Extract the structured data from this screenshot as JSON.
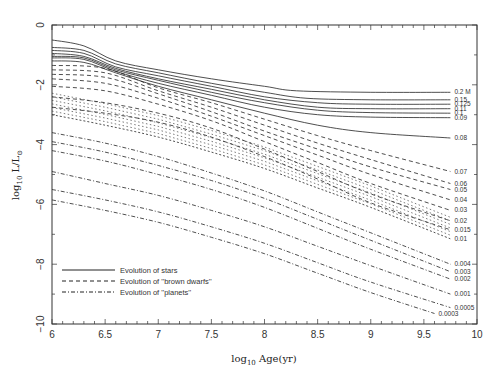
{
  "chart_data": {
    "type": "line",
    "title": "",
    "xlabel": "log10 Age(yr)",
    "ylabel": "log10 L/L_sun",
    "xlim": [
      6,
      10
    ],
    "ylim": [
      -10,
      0
    ],
    "grid": false,
    "x_ticks": [
      "6",
      "6.5",
      "7",
      "7.5",
      "8",
      "8.5",
      "9",
      "9.5",
      "10"
    ],
    "y_ticks": [
      "0",
      "-2",
      "-4",
      "-6",
      "-8",
      "-10"
    ],
    "legend": {
      "position": "lower-left",
      "entries": [
        {
          "label": "Evolution of stars",
          "style": "solid"
        },
        {
          "label": "Evolution of ''brown dwarfs''",
          "style": "dashed"
        },
        {
          "label": "Evolution of ''planets''",
          "style": "dashdot"
        }
      ]
    },
    "mass_unit_label": "M",
    "series": [
      {
        "name": "0.2",
        "label": "0.2 M",
        "class": "star",
        "points": [
          [
            6,
            -0.5
          ],
          [
            6.3,
            -0.7
          ],
          [
            6.6,
            -1.2
          ],
          [
            7,
            -1.5
          ],
          [
            7.5,
            -1.8
          ],
          [
            8,
            -2.05
          ],
          [
            8.3,
            -2.2
          ],
          [
            9,
            -2.25
          ],
          [
            9.75,
            -2.25
          ]
        ]
      },
      {
        "name": "0.15",
        "label": "0.15",
        "class": "star",
        "points": [
          [
            6,
            -0.75
          ],
          [
            6.3,
            -0.85
          ],
          [
            6.6,
            -1.3
          ],
          [
            7,
            -1.6
          ],
          [
            7.5,
            -1.95
          ],
          [
            8,
            -2.25
          ],
          [
            8.4,
            -2.45
          ],
          [
            9,
            -2.5
          ],
          [
            9.75,
            -2.5
          ]
        ]
      },
      {
        "name": "0.125",
        "label": "0.125",
        "class": "star",
        "points": [
          [
            6,
            -0.85
          ],
          [
            6.3,
            -0.95
          ],
          [
            6.6,
            -1.4
          ],
          [
            7,
            -1.7
          ],
          [
            7.5,
            -2.05
          ],
          [
            8,
            -2.4
          ],
          [
            8.5,
            -2.6
          ],
          [
            9,
            -2.65
          ],
          [
            9.75,
            -2.65
          ]
        ]
      },
      {
        "name": "0.11",
        "label": "0.11",
        "class": "star",
        "points": [
          [
            6,
            -0.95
          ],
          [
            6.3,
            -1.05
          ],
          [
            6.6,
            -1.45
          ],
          [
            7,
            -1.8
          ],
          [
            7.5,
            -2.15
          ],
          [
            8,
            -2.5
          ],
          [
            8.5,
            -2.75
          ],
          [
            9,
            -2.8
          ],
          [
            9.75,
            -2.8
          ]
        ]
      },
      {
        "name": "0.1",
        "label": "0.1",
        "class": "star",
        "points": [
          [
            6,
            -1.05
          ],
          [
            6.3,
            -1.1
          ],
          [
            6.6,
            -1.5
          ],
          [
            7,
            -1.85
          ],
          [
            7.5,
            -2.25
          ],
          [
            8,
            -2.6
          ],
          [
            8.5,
            -2.85
          ],
          [
            9,
            -2.93
          ],
          [
            9.75,
            -2.95
          ]
        ]
      },
      {
        "name": "0.09",
        "label": "0.09",
        "class": "star",
        "points": [
          [
            6,
            -1.1
          ],
          [
            6.3,
            -1.15
          ],
          [
            6.6,
            -1.55
          ],
          [
            7,
            -1.95
          ],
          [
            7.5,
            -2.35
          ],
          [
            8,
            -2.75
          ],
          [
            8.5,
            -3.0
          ],
          [
            9,
            -3.08
          ],
          [
            9.75,
            -3.1
          ]
        ]
      },
      {
        "name": "0.08",
        "label": "0.08",
        "class": "star",
        "points": [
          [
            6,
            -1.2
          ],
          [
            6.3,
            -1.25
          ],
          [
            6.6,
            -1.6
          ],
          [
            7,
            -2.05
          ],
          [
            7.5,
            -2.5
          ],
          [
            8,
            -2.95
          ],
          [
            8.5,
            -3.35
          ],
          [
            9,
            -3.6
          ],
          [
            9.75,
            -3.78
          ]
        ]
      },
      {
        "name": "0.07",
        "label": "0.07",
        "class": "bd",
        "points": [
          [
            6,
            -1.35
          ],
          [
            6.5,
            -1.45
          ],
          [
            7,
            -2.1
          ],
          [
            7.5,
            -2.6
          ],
          [
            8,
            -3.15
          ],
          [
            8.5,
            -3.7
          ],
          [
            9,
            -4.2
          ],
          [
            9.75,
            -4.9
          ]
        ]
      },
      {
        "name": "0.06",
        "label": "0.06",
        "class": "bd",
        "points": [
          [
            6,
            -1.5
          ],
          [
            6.5,
            -1.6
          ],
          [
            7,
            -2.2
          ],
          [
            7.5,
            -2.75
          ],
          [
            8,
            -3.35
          ],
          [
            8.5,
            -3.95
          ],
          [
            9,
            -4.5
          ],
          [
            9.75,
            -5.3
          ]
        ]
      },
      {
        "name": "0.05",
        "label": "0.05",
        "class": "bd",
        "points": [
          [
            6,
            -1.65
          ],
          [
            6.5,
            -1.75
          ],
          [
            7,
            -2.3
          ],
          [
            7.5,
            -2.9
          ],
          [
            8,
            -3.55
          ],
          [
            8.5,
            -4.15
          ],
          [
            9,
            -4.75
          ],
          [
            9.75,
            -5.5
          ]
        ]
      },
      {
        "name": "0.04",
        "label": "0.04",
        "class": "bd",
        "points": [
          [
            6,
            -1.8
          ],
          [
            6.5,
            -1.95
          ],
          [
            7,
            -2.45
          ],
          [
            7.5,
            -3.05
          ],
          [
            8,
            -3.7
          ],
          [
            8.5,
            -4.35
          ],
          [
            9,
            -5.0
          ],
          [
            9.75,
            -5.85
          ]
        ]
      },
      {
        "name": "0.03",
        "label": "0.03",
        "class": "bd",
        "points": [
          [
            6,
            -2.05
          ],
          [
            6.5,
            -2.2
          ],
          [
            7,
            -2.65
          ],
          [
            7.5,
            -3.2
          ],
          [
            8,
            -3.9
          ],
          [
            8.5,
            -4.6
          ],
          [
            9,
            -5.3
          ],
          [
            9.75,
            -6.2
          ]
        ]
      },
      {
        "name": "0.02",
        "label": "0.02",
        "class": "bd",
        "points": [
          [
            6,
            -2.4
          ],
          [
            6.5,
            -2.6
          ],
          [
            7,
            -2.95
          ],
          [
            7.5,
            -3.45
          ],
          [
            8,
            -4.15
          ],
          [
            8.5,
            -4.9
          ],
          [
            9,
            -5.65
          ],
          [
            9.75,
            -6.55
          ]
        ]
      },
      {
        "name": "0.015",
        "label": "0.015",
        "class": "bd",
        "points": [
          [
            6,
            -2.75
          ],
          [
            6.5,
            -2.95
          ],
          [
            7,
            -3.25
          ],
          [
            7.5,
            -3.75
          ],
          [
            8,
            -4.4
          ],
          [
            8.5,
            -5.15
          ],
          [
            9,
            -5.95
          ],
          [
            9.75,
            -6.85
          ]
        ]
      },
      {
        "name": "0.01",
        "label": "0.01",
        "class": "dense",
        "points": [
          [
            6,
            -3.0
          ],
          [
            6.5,
            -3.35
          ],
          [
            7,
            -3.75
          ],
          [
            7.5,
            -4.25
          ],
          [
            8,
            -4.8
          ],
          [
            8.5,
            -5.45
          ],
          [
            9,
            -6.1
          ],
          [
            9.75,
            -7.15
          ]
        ]
      },
      {
        "name": "0.004",
        "label": "0.004",
        "class": "planet",
        "points": [
          [
            6,
            -3.6
          ],
          [
            6.5,
            -3.95
          ],
          [
            7,
            -4.4
          ],
          [
            7.5,
            -4.95
          ],
          [
            8,
            -5.55
          ],
          [
            8.5,
            -6.25
          ],
          [
            9,
            -6.95
          ],
          [
            9.75,
            -8.0
          ]
        ]
      },
      {
        "name": "0.003",
        "label": "0.003",
        "class": "planet",
        "points": [
          [
            6,
            -3.9
          ],
          [
            6.5,
            -4.25
          ],
          [
            7,
            -4.7
          ],
          [
            7.5,
            -5.2
          ],
          [
            8,
            -5.8
          ],
          [
            8.5,
            -6.5
          ],
          [
            9,
            -7.2
          ],
          [
            9.75,
            -8.25
          ]
        ]
      },
      {
        "name": "0.002",
        "label": "0.002",
        "class": "planet",
        "points": [
          [
            6,
            -4.2
          ],
          [
            6.5,
            -4.55
          ],
          [
            7,
            -5.0
          ],
          [
            7.5,
            -5.5
          ],
          [
            8,
            -6.1
          ],
          [
            8.5,
            -6.8
          ],
          [
            9,
            -7.5
          ],
          [
            9.75,
            -8.5
          ]
        ]
      },
      {
        "name": "0.001",
        "label": "0.001",
        "class": "planet",
        "points": [
          [
            6,
            -4.9
          ],
          [
            6.5,
            -5.3
          ],
          [
            7,
            -5.7
          ],
          [
            7.5,
            -6.2
          ],
          [
            8,
            -6.75
          ],
          [
            8.5,
            -7.4
          ],
          [
            9,
            -8.05
          ],
          [
            9.75,
            -9.0
          ]
        ]
      },
      {
        "name": "0.0005",
        "label": "0.0005",
        "class": "planet",
        "points": [
          [
            6,
            -5.5
          ],
          [
            6.5,
            -5.85
          ],
          [
            7,
            -6.25
          ],
          [
            7.5,
            -6.75
          ],
          [
            8,
            -7.3
          ],
          [
            8.5,
            -7.95
          ],
          [
            9,
            -8.6
          ],
          [
            9.75,
            -9.45
          ]
        ]
      },
      {
        "name": "0.0003",
        "label": "0.0003",
        "class": "planet",
        "points": [
          [
            6,
            -5.85
          ],
          [
            6.5,
            -6.2
          ],
          [
            7,
            -6.6
          ],
          [
            7.5,
            -7.1
          ],
          [
            8,
            -7.65
          ],
          [
            8.5,
            -8.3
          ],
          [
            9,
            -8.95
          ],
          [
            9.6,
            -9.65
          ]
        ]
      }
    ]
  },
  "style": {
    "line_color": "#222222",
    "axis_color": "#333333",
    "background": "#ffffff"
  }
}
